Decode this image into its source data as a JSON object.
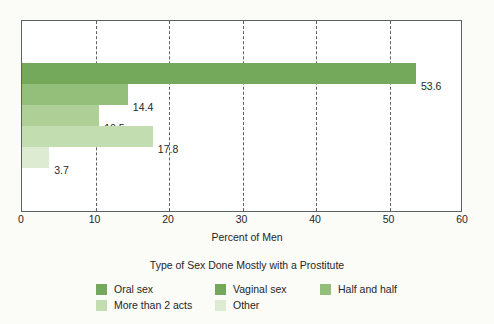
{
  "chart_data": {
    "type": "bar",
    "orientation": "horizontal",
    "title": "",
    "legend_title": "Type of Sex Done Mostly with a Prostitute",
    "xlabel": "Percent of Men",
    "ylabel": "",
    "xlim": [
      0,
      60
    ],
    "xticks": [
      0,
      10,
      20,
      30,
      40,
      50,
      60
    ],
    "xtick_labels": [
      "0",
      "10",
      "20",
      "30",
      "40",
      "50",
      "60"
    ],
    "grid": "vertical-dashed",
    "legend_position": "bottom",
    "categories": [
      "Oral sex",
      "Vaginal sex",
      "Half and half",
      "More than 2 acts",
      "Other"
    ],
    "values": [
      53.6,
      14.4,
      10.5,
      17.8,
      3.7
    ],
    "value_labels": [
      "53.6",
      "14.4",
      "10.5",
      "17.8",
      "3.7"
    ],
    "colors": [
      "#76a champion",
      "#000000",
      "#000000",
      "#000000",
      "#000000"
    ],
    "bar_colors": [
      "#74a85a",
      "#93bf7b",
      "#aed096",
      "#c2ddb0",
      "#dcebd1"
    ]
  },
  "axis": {
    "x_title": "Percent of Men",
    "ticks": [
      {
        "value": 0,
        "label": "0"
      },
      {
        "value": 10,
        "label": "10"
      },
      {
        "value": 20,
        "label": "20"
      },
      {
        "value": 30,
        "label": "30"
      },
      {
        "value": 40,
        "label": "40"
      },
      {
        "value": 50,
        "label": "50"
      },
      {
        "value": 60,
        "label": "60"
      }
    ]
  },
  "legend": {
    "title": "Type of Sex Done Mostly with a Prostitute",
    "rows": [
      [
        {
          "label": "Oral sex",
          "color": "#74a85a"
        },
        {
          "label": "Vaginal sex",
          "color": "#74a85a"
        },
        {
          "label": "Half and half",
          "color": "#93bf7b"
        }
      ],
      [
        {
          "label": "More than 2 acts",
          "color": "#c2ddb0"
        },
        {
          "label": "Other",
          "color": "#dcebd1"
        }
      ]
    ]
  },
  "bars": [
    {
      "category": "Oral sex",
      "value": 53.6,
      "label": "53.6",
      "color": "#74a85a"
    },
    {
      "category": "Vaginal sex",
      "value": 14.4,
      "label": "14.4",
      "color": "#93bf7b"
    },
    {
      "category": "Half and half",
      "value": 10.5,
      "label": "10.5",
      "color": "#aed096"
    },
    {
      "category": "More than 2 acts",
      "value": 17.8,
      "label": "17.8",
      "color": "#c2ddb0"
    },
    {
      "category": "Other",
      "value": 3.7,
      "label": "3.7",
      "color": "#dcebd1"
    }
  ],
  "theme": {
    "frame_color": "#5c6166",
    "grid_color": "#5a6065",
    "text_color": "#262626",
    "background": "#fbfbf8",
    "plot_background": "#ffffff"
  }
}
